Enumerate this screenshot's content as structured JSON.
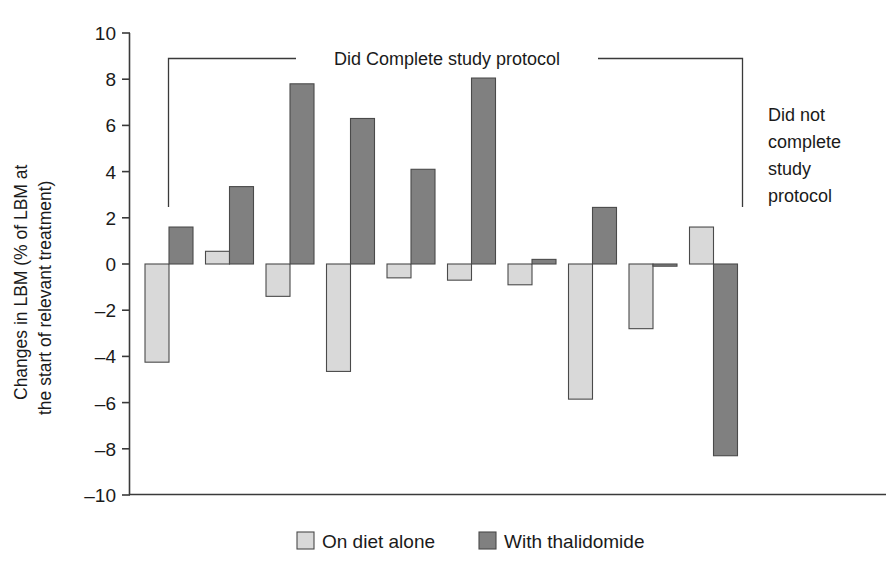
{
  "chart_data": {
    "type": "bar",
    "title": "",
    "xlabel": "",
    "ylabel": "Changes in LBM (% of LBM at the start of relevant treatment)",
    "ylabel_line1": "Changes in LBM (% of LBM at",
    "ylabel_line2": "the start of relevant treatment)",
    "ylim": [
      -10,
      10
    ],
    "ytick_values": [
      10,
      8,
      6,
      4,
      2,
      0,
      -2,
      -4,
      -6,
      -8,
      -10
    ],
    "ytick_labels": [
      "10",
      "8",
      "6",
      "4",
      "2",
      "0",
      "–2",
      "–4",
      "–6",
      "–8",
      "–10"
    ],
    "grid": false,
    "legend_position": "bottom",
    "categories": [
      "P1",
      "P2",
      "P3",
      "P4",
      "P5",
      "P6",
      "P7",
      "P8",
      "P9",
      "P10"
    ],
    "series": [
      {
        "name": "On diet alone",
        "color": "#d9d9d9",
        "values": [
          -4.25,
          0.55,
          -1.4,
          -4.65,
          -0.6,
          -0.7,
          -0.9,
          -5.85,
          -2.8,
          1.6
        ]
      },
      {
        "name": "With thalidomide",
        "color": "#808080",
        "values": [
          1.6,
          3.35,
          7.8,
          6.3,
          4.1,
          8.05,
          0.2,
          2.45,
          -0.05,
          -8.3
        ]
      }
    ],
    "annotations": [
      {
        "name": "did-complete-bracket",
        "text": "Did Complete study protocol",
        "covers_categories": [
          "P1",
          "P2",
          "P3",
          "P4",
          "P5",
          "P6",
          "P7",
          "P8"
        ]
      },
      {
        "name": "did-not-complete-label",
        "text": "Did not complete study protocol",
        "lines": [
          "Did not",
          "complete",
          "study",
          "protocol"
        ],
        "covers_categories": [
          "P9",
          "P10"
        ]
      }
    ]
  },
  "legend": {
    "items": [
      {
        "label": "On diet alone",
        "color": "#d9d9d9"
      },
      {
        "label": "With thalidomide",
        "color": "#808080"
      }
    ]
  },
  "colors": {
    "diet_alone": "#d9d9d9",
    "thalidomide": "#808080",
    "axis": "#3a3a3a",
    "text": "#1a1a1a",
    "background": "#ffffff"
  }
}
